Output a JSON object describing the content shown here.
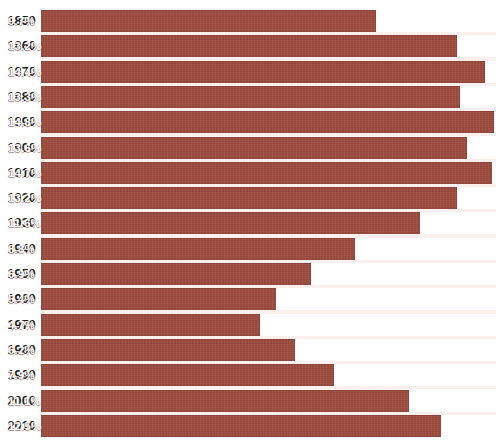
{
  "chart_data": {
    "type": "bar",
    "orientation": "horizontal",
    "title": "",
    "subtitle": "",
    "xlabel": "",
    "ylabel": "",
    "grid": false,
    "legend": null,
    "value_suffix": "%",
    "categories": [
      "1850",
      "1860",
      "1870",
      "1880",
      "1890",
      "1900",
      "1910",
      "1920",
      "1930",
      "1940",
      "1950",
      "1960",
      "1970",
      "1980",
      "1990",
      "2000",
      "2010"
    ],
    "values": [
      9.7,
      13.2,
      14.4,
      13.3,
      14.8,
      13.6,
      14.7,
      13.2,
      11.6,
      8.8,
      6.9,
      5.4,
      4.7,
      6.2,
      7.9,
      11.1,
      12.5
    ],
    "value_labels": [
      "9.7%",
      "13.2%",
      "14.4%",
      "13.3%",
      "14.8%",
      "13.6%",
      "14.7%",
      "13.2%",
      "11.6%",
      "8.8%",
      "6.9%",
      "5.4%",
      "4.7%",
      "6.2%",
      "7.9%",
      "11.1%",
      "12.5%"
    ],
    "xlim": [
      0,
      15
    ],
    "bar_color": "#9c4a3c",
    "label_color": "#1d1d1d",
    "value_color": "#ffffff",
    "background": "#ffffff",
    "gap_color": "#fbf0ee"
  },
  "layout": {
    "bar_origin_x": 41,
    "bar_base_width": 110,
    "px_per_percent": 23.2,
    "row_pitch": 25.3,
    "first_row_top": 10,
    "bar_height": 22
  }
}
